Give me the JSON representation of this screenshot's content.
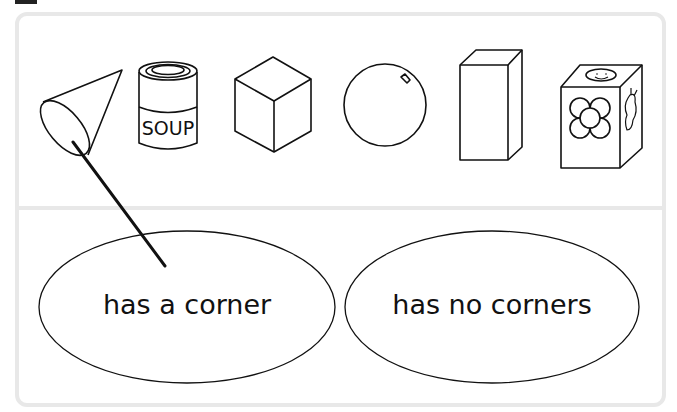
{
  "worksheet": {
    "shapes": [
      {
        "name": "cone",
        "label": ""
      },
      {
        "name": "soup-can",
        "label": "SOUP"
      },
      {
        "name": "cube",
        "label": ""
      },
      {
        "name": "sphere",
        "label": ""
      },
      {
        "name": "cuboid",
        "label": ""
      },
      {
        "name": "toy-cube",
        "label": ""
      }
    ],
    "categories": [
      {
        "label": "has a corner"
      },
      {
        "label": "has no corners"
      }
    ],
    "connections": [
      {
        "from": "cone",
        "to": "has a corner"
      }
    ]
  }
}
